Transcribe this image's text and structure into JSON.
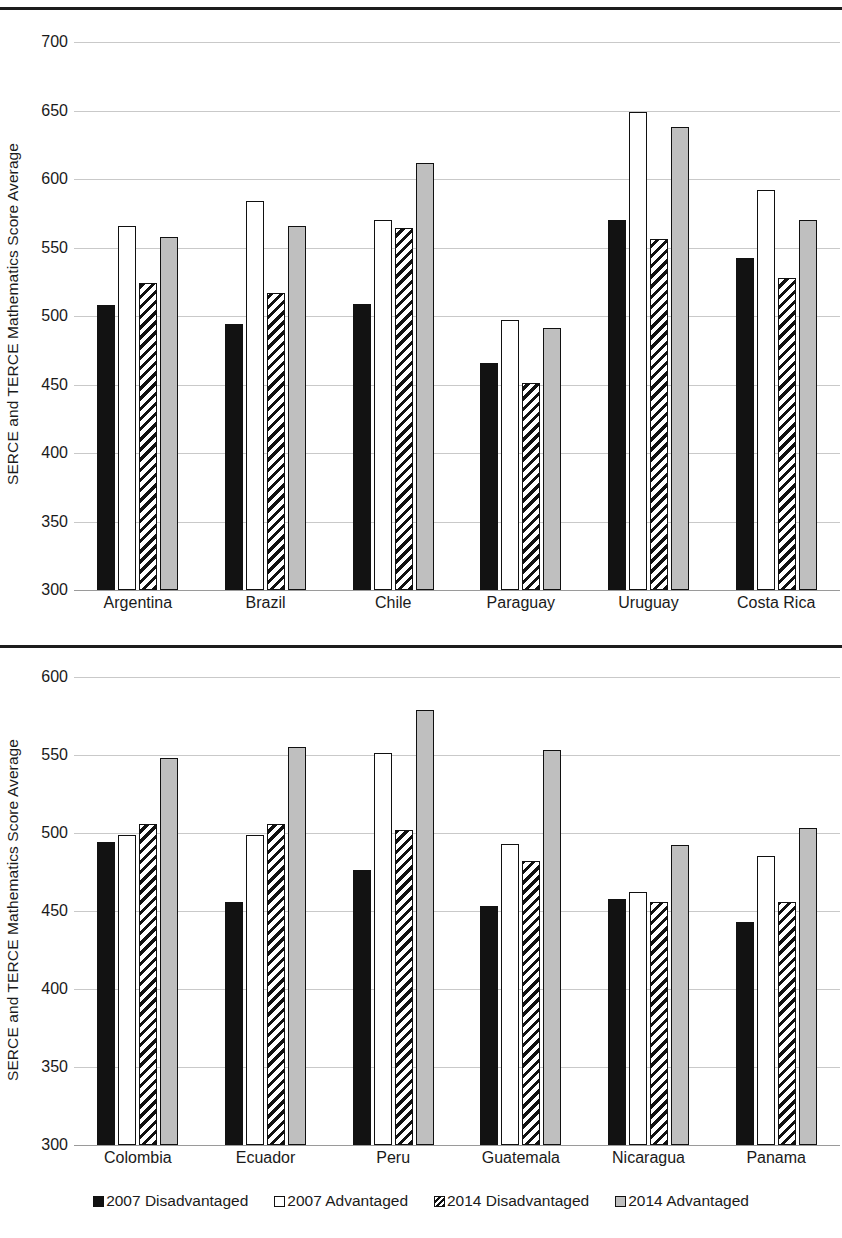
{
  "figure": {
    "legend": [
      {
        "label": "2007 Disadvantaged",
        "swatch": "solid-black-swatch"
      },
      {
        "label": "2007 Advantaged",
        "swatch": "open-white-swatch"
      },
      {
        "label": "2014 Disadvantaged",
        "swatch": "diagonal-hatch-swatch"
      },
      {
        "label": "2014 Advantaged",
        "swatch": "solid-gray-swatch"
      }
    ],
    "colors": {
      "series_2007_disadvantaged": "#121212",
      "series_2007_advantaged": "#ffffff",
      "series_2014_disadvantaged": "#ffffff",
      "series_2014_advantaged": "#bfbfbf",
      "outline": "#111111",
      "gridline": "#c9c9c9",
      "rule": "#1d1d1d"
    }
  },
  "chart_data": [
    {
      "type": "bar",
      "title": "",
      "xlabel": "",
      "ylabel": "SERCE and TERCE Mathematics Score Average",
      "ylim": [
        300,
        700
      ],
      "yticks": [
        300,
        350,
        400,
        450,
        500,
        550,
        600,
        650,
        700
      ],
      "grid": true,
      "legend_position": "bottom",
      "categories": [
        "Argentina",
        "Brazil",
        "Chile",
        "Paraguay",
        "Uruguay",
        "Costa Rica"
      ],
      "series": [
        {
          "name": "2007 Disadvantaged",
          "values": [
            508,
            494,
            509,
            466,
            570,
            542
          ]
        },
        {
          "name": "2007 Advantaged",
          "values": [
            566,
            584,
            570,
            497,
            649,
            592
          ]
        },
        {
          "name": "2014 Disadvantaged",
          "values": [
            524,
            517,
            564,
            451,
            556,
            528
          ]
        },
        {
          "name": "2014 Advantaged",
          "values": [
            558,
            566,
            612,
            491,
            638,
            570
          ]
        }
      ]
    },
    {
      "type": "bar",
      "title": "",
      "xlabel": "",
      "ylabel": "SERCE and TERCE Mathematics Score Average",
      "ylim": [
        300,
        600
      ],
      "yticks": [
        300,
        350,
        400,
        450,
        500,
        550,
        600
      ],
      "grid": true,
      "legend_position": "bottom",
      "categories": [
        "Colombia",
        "Ecuador",
        "Peru",
        "Guatemala",
        "Nicaragua",
        "Panama"
      ],
      "series": [
        {
          "name": "2007 Disadvantaged",
          "values": [
            494,
            456,
            476,
            453,
            458,
            443
          ]
        },
        {
          "name": "2007 Advantaged",
          "values": [
            499,
            499,
            551,
            493,
            462,
            485
          ]
        },
        {
          "name": "2014 Disadvantaged",
          "values": [
            506,
            506,
            502,
            482,
            456,
            456
          ]
        },
        {
          "name": "2014 Advantaged",
          "values": [
            548,
            555,
            579,
            553,
            492,
            503
          ]
        }
      ]
    }
  ]
}
